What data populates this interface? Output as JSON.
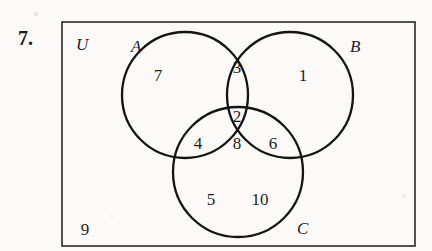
{
  "figure": {
    "problem_number": "7.",
    "universe_label": "U",
    "diagram_type": "venn-three-set"
  },
  "geometry": {
    "rect": {
      "x": 62,
      "y": 22,
      "width": 353,
      "height": 224
    },
    "circles": [
      {
        "id": "A",
        "cx": 185,
        "cy": 95,
        "r": 63
      },
      {
        "id": "B",
        "cx": 290,
        "cy": 95,
        "r": 63
      },
      {
        "id": "C",
        "cx": 238,
        "cy": 172,
        "r": 65
      }
    ]
  },
  "set_labels": [
    {
      "name": "A",
      "text": "A",
      "x": 131,
      "y": 52
    },
    {
      "name": "B",
      "text": "B",
      "x": 350,
      "y": 52
    },
    {
      "name": "C",
      "text": "C",
      "x": 297,
      "y": 234
    }
  ],
  "regions": [
    {
      "name": "a-only",
      "region": "A only",
      "value": "7",
      "x": 158,
      "y": 81
    },
    {
      "name": "a-b",
      "region": "A and B",
      "value": "3",
      "x": 237,
      "y": 73
    },
    {
      "name": "b-only",
      "region": "B only",
      "value": "1",
      "x": 303,
      "y": 81
    },
    {
      "name": "a-b-c-upper",
      "region": "A, B and C",
      "value": "2",
      "x": 237,
      "y": 122
    },
    {
      "name": "a-c",
      "region": "A and C",
      "value": "4",
      "x": 198,
      "y": 149
    },
    {
      "name": "a-b-c-lower",
      "region": "A, B and C",
      "value": "8",
      "x": 237,
      "y": 149
    },
    {
      "name": "b-c",
      "region": "B and C",
      "value": "6",
      "x": 273,
      "y": 149
    },
    {
      "name": "c-only-left",
      "region": "C only",
      "value": "5",
      "x": 211,
      "y": 205
    },
    {
      "name": "c-only-right",
      "region": "C only",
      "value": "10",
      "x": 260,
      "y": 205
    },
    {
      "name": "outside",
      "region": "Outside sets",
      "value": "9",
      "x": 85,
      "y": 235
    }
  ],
  "colors": {
    "background": "#fbfaf8",
    "ink": "#141414",
    "rect_stroke": "#2a2a2a"
  }
}
